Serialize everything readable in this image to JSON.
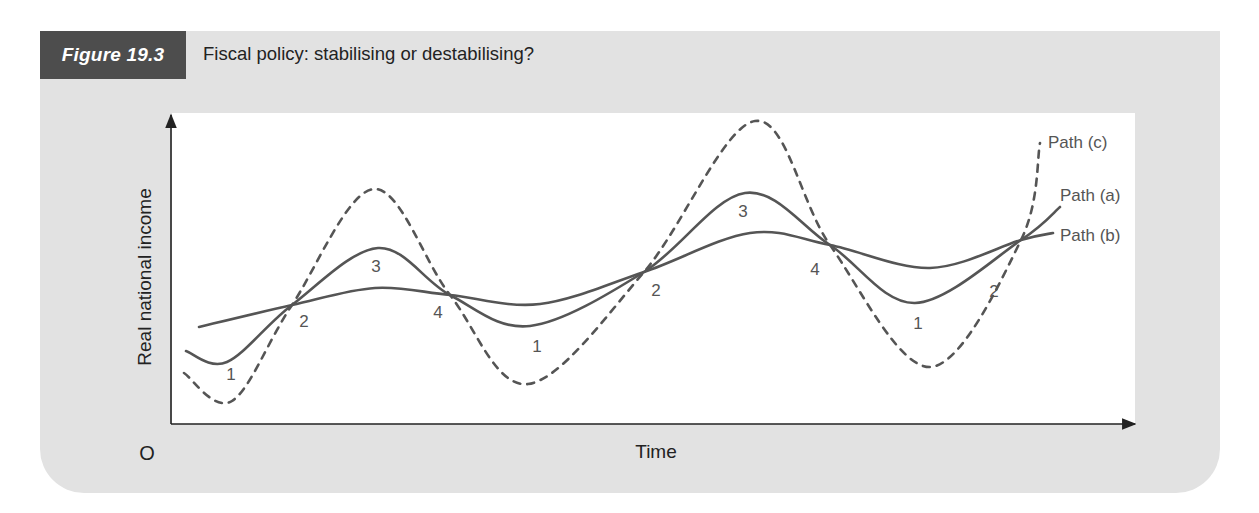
{
  "figure": {
    "number_label": "Figure 19.3",
    "title": "Fiscal policy: stabilising or destabilising?"
  },
  "colors": {
    "panel": "#e2e2e2",
    "badge": "#4d4d4d",
    "curve": "#555555",
    "axis": "#222222",
    "label": "#555555"
  },
  "chart_data": {
    "type": "line",
    "title": "Fiscal policy: stabilising or destabilising?",
    "xlabel": "Time",
    "ylabel": "Real national income",
    "origin_label": "O",
    "grid": false,
    "axis_ticks": "none",
    "legend_position": "inline-right",
    "x": [
      0,
      1,
      2,
      3,
      4,
      5,
      6,
      7,
      8
    ],
    "x_phase_labels": [
      "start",
      "2",
      "3",
      "4",
      "1",
      "2",
      "3",
      "4",
      "1",
      "2",
      "end"
    ],
    "series": [
      {
        "name": "Path (a)",
        "style": "solid",
        "description": "Moderate fluctuations (fiscal policy partially stabilising/actual path)",
        "points": [
          [
            186,
            351
          ],
          [
            227,
            362
          ],
          [
            292,
            305
          ],
          [
            378,
            248
          ],
          [
            450,
            295
          ],
          [
            530,
            326
          ],
          [
            644,
            272
          ],
          [
            745,
            193
          ],
          [
            830,
            245
          ],
          [
            915,
            303
          ],
          [
            1021,
            240
          ],
          [
            1060,
            207
          ]
        ]
      },
      {
        "name": "Path (b)",
        "style": "solid",
        "description": "Dampened fluctuations (stabilising fiscal policy)",
        "points": [
          [
            199,
            327
          ],
          [
            292,
            305
          ],
          [
            375,
            288
          ],
          [
            450,
            295
          ],
          [
            540,
            304
          ],
          [
            644,
            272
          ],
          [
            750,
            233
          ],
          [
            830,
            245
          ],
          [
            930,
            268
          ],
          [
            1021,
            240
          ],
          [
            1053,
            233
          ]
        ]
      },
      {
        "name": "Path (c)",
        "style": "dashed",
        "description": "Amplified fluctuations (destabilising fiscal policy)",
        "points": [
          [
            184,
            373
          ],
          [
            232,
            401
          ],
          [
            292,
            305
          ],
          [
            374,
            189
          ],
          [
            450,
            295
          ],
          [
            528,
            384
          ],
          [
            644,
            272
          ],
          [
            755,
            121
          ],
          [
            830,
            245
          ],
          [
            930,
            367
          ],
          [
            1021,
            240
          ],
          [
            1040,
            143
          ]
        ]
      }
    ],
    "phase_annotations": [
      {
        "text": "1",
        "x": 231,
        "y": 376
      },
      {
        "text": "2",
        "x": 304,
        "y": 323
      },
      {
        "text": "3",
        "x": 376,
        "y": 268
      },
      {
        "text": "4",
        "x": 438,
        "y": 314
      },
      {
        "text": "1",
        "x": 537,
        "y": 348
      },
      {
        "text": "2",
        "x": 656,
        "y": 292
      },
      {
        "text": "3",
        "x": 743,
        "y": 213
      },
      {
        "text": "4",
        "x": 815,
        "y": 271
      },
      {
        "text": "1",
        "x": 918,
        "y": 325
      },
      {
        "text": "2",
        "x": 994,
        "y": 293
      }
    ],
    "series_labels": [
      {
        "text": "Path (c)",
        "x": 1048,
        "y": 148
      },
      {
        "text": "Path (a)",
        "x": 1060,
        "y": 201
      },
      {
        "text": "Path (b)",
        "x": 1060,
        "y": 241
      }
    ]
  }
}
